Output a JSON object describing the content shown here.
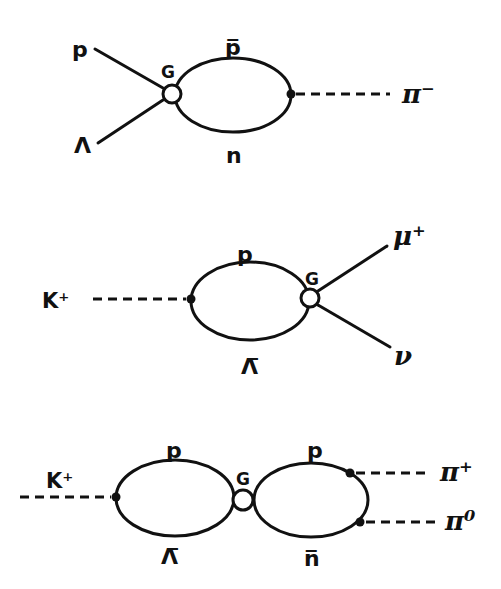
{
  "diagrams": [
    {
      "id": "d1",
      "labels": {
        "in_top": "p",
        "in_bottom": "Λ",
        "vertex": "G",
        "loop_top": "p̅",
        "loop_bottom": "n",
        "out": "π⁻"
      }
    },
    {
      "id": "d2",
      "labels": {
        "in": "K⁺",
        "loop_top": "p",
        "loop_bottom": "Λ̅",
        "vertex": "G",
        "out_top": "μ⁺",
        "out_bottom": "ν"
      }
    },
    {
      "id": "d3",
      "labels": {
        "in": "K⁺",
        "left_loop_top": "p",
        "left_loop_bottom": "Λ̅",
        "vertex": "G",
        "right_loop_top": "p",
        "right_loop_bottom": "n̅",
        "out_top": "π⁺",
        "out_bottom": "π⁰"
      }
    }
  ]
}
